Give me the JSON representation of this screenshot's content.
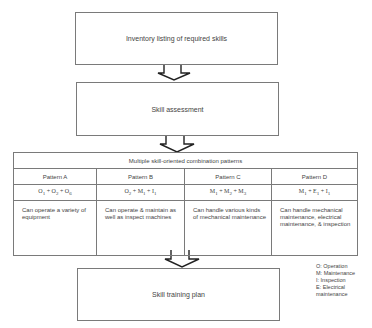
{
  "steps": {
    "inventory": "Inventory listing of required skills",
    "assessment": "Skill assessment",
    "training": "Skill training plan"
  },
  "patterns_table": {
    "header": "Multiple skill-oriented combination patterns",
    "columns": [
      {
        "name": "Pattern A",
        "formula": [
          {
            "letter": "O",
            "sub": "1"
          },
          {
            "letter": "O",
            "sub": "2"
          },
          {
            "letter": "O",
            "sub": "6"
          }
        ],
        "description": "Can operate a variety of equipment"
      },
      {
        "name": "Pattern B",
        "formula": [
          {
            "letter": "O",
            "sub": "2"
          },
          {
            "letter": "M",
            "sub": "1"
          },
          {
            "letter": "I",
            "sub": "1"
          }
        ],
        "description": "Can operate & maintain as well as inspect machines"
      },
      {
        "name": "Pattern C",
        "formula": [
          {
            "letter": "M",
            "sub": "1"
          },
          {
            "letter": "M",
            "sub": "2"
          },
          {
            "letter": "M",
            "sub": "3"
          }
        ],
        "description": "Can handle various kinds of mechanical maintenance"
      },
      {
        "name": "Pattern D",
        "formula": [
          {
            "letter": "M",
            "sub": "1"
          },
          {
            "letter": "E",
            "sub": "1"
          },
          {
            "letter": "I",
            "sub": "1"
          }
        ],
        "description": "Can handle mechanical maintenance, electrical maintenance, & inspection"
      }
    ]
  },
  "legend": [
    "O: Operation",
    "M: Maintenance",
    "I: Inspection",
    "E: Electrical maintenance"
  ]
}
